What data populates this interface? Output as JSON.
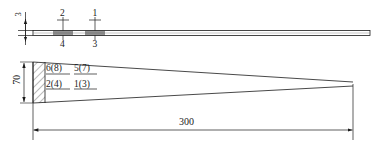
{
  "drawing": {
    "title": "Cross-section and plan view of tapered plate",
    "views": {
      "elevation": {
        "name": "side-elevation-view",
        "thickness_label": "3",
        "node_labels_top": [
          "2",
          "1"
        ],
        "node_labels_bottom": [
          "4",
          "3"
        ],
        "bar_length_px": 350
      },
      "plan": {
        "name": "plan-taper-view",
        "width_label": "70",
        "length_label": "300",
        "node_labels_top": [
          "6(8)",
          "5(7)"
        ],
        "node_labels_bottom": [
          "2(4)",
          "1(3)"
        ]
      }
    }
  },
  "colors": {
    "line": "#1a1a1a",
    "hatch": "#555555",
    "background": "#ffffff"
  }
}
